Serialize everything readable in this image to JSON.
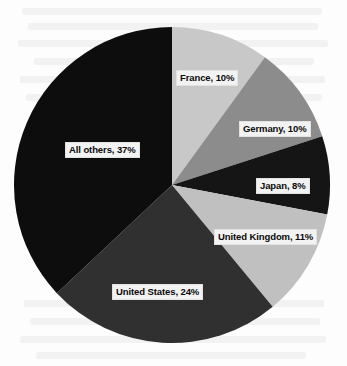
{
  "figure": {
    "background_color": "#fdfdfd",
    "label_box_color": "#f2f2f2",
    "label_text_color": "#0a0a0a"
  },
  "chart_data": {
    "type": "pie",
    "title": "",
    "subtitle": "",
    "xlabel": "",
    "ylabel": "",
    "grid": false,
    "legend_position": "none",
    "label_format": "{name}, {value}%",
    "start_angle_deg": 0,
    "direction": "clockwise",
    "center": {
      "x": 172,
      "y": 185
    },
    "radius": 158,
    "categories": [
      "France",
      "Germany",
      "Japan",
      "United Kingdom",
      "United States",
      "All others"
    ],
    "values": [
      10,
      10,
      8,
      11,
      24,
      37
    ],
    "units": "percent",
    "colors": [
      "#c8c8c8",
      "#8c8c8c",
      "#151515",
      "#c0c0c0",
      "#303030",
      "#0d0d0d"
    ],
    "slices": [
      {
        "name": "France",
        "value": 10,
        "label": "France, 10%",
        "color": "#c8c8c8",
        "start_deg": 0,
        "end_deg": 36
      },
      {
        "name": "Germany",
        "value": 10,
        "label": "Germany, 10%",
        "color": "#8c8c8c",
        "start_deg": 36,
        "end_deg": 72
      },
      {
        "name": "Japan",
        "value": 8,
        "label": "Japan, 8%",
        "color": "#151515",
        "start_deg": 72,
        "end_deg": 100.8
      },
      {
        "name": "United Kingdom",
        "value": 11,
        "label": "United Kingdom, 11%",
        "color": "#c0c0c0",
        "start_deg": 100.8,
        "end_deg": 140.4
      },
      {
        "name": "United States",
        "value": 24,
        "label": "United States, 24%",
        "color": "#303030",
        "start_deg": 140.4,
        "end_deg": 226.8
      },
      {
        "name": "All others",
        "value": 37,
        "label": "All others, 37%",
        "color": "#0d0d0d",
        "start_deg": 226.8,
        "end_deg": 360
      }
    ]
  }
}
